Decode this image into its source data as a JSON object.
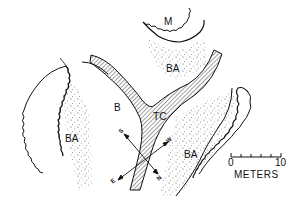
{
  "diagram": {
    "type": "field site sketch map",
    "colors": {
      "ink": "#111111",
      "paper": "#ffffff"
    },
    "regions": [
      {
        "id": "M",
        "label": "M",
        "description": "scalloped mound at top center"
      },
      {
        "id": "BA_top",
        "label": "BA",
        "description": "stippled area below M"
      },
      {
        "id": "BA_left",
        "label": "BA",
        "description": "stippled band between left scalloped ridges"
      },
      {
        "id": "B",
        "label": "B",
        "description": "open area left of channel junction"
      },
      {
        "id": "TC",
        "label": "TC",
        "description": "hatched channel junction (Y-shaped)"
      },
      {
        "id": "BA_right",
        "label": "BA",
        "description": "stippled band right of channel"
      }
    ],
    "compass": {
      "labels": {
        "s": "S",
        "w": "W",
        "e": "E",
        "n": "N"
      }
    },
    "scale_bar": {
      "start": "0",
      "end": "10",
      "units": "METERS",
      "ticks": 6
    }
  }
}
